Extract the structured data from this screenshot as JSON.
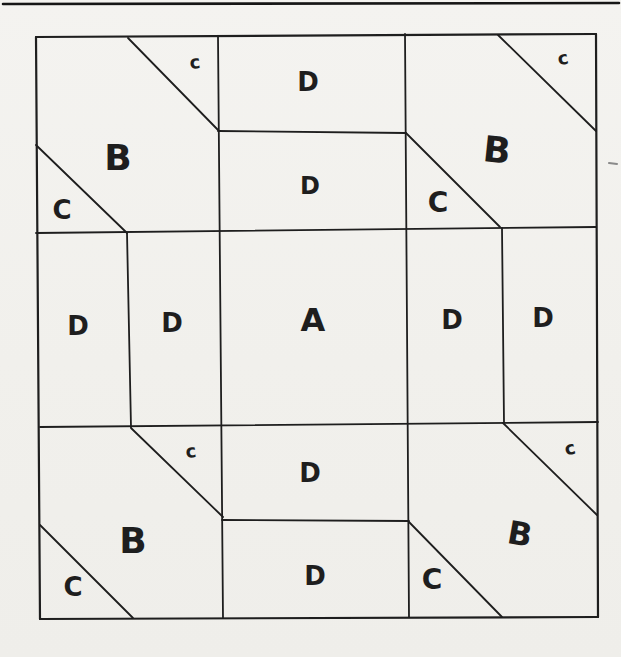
{
  "page": {
    "width": 621,
    "height": 657,
    "paper_color": "#f2f1ee",
    "ink_color": "#1e1e1e"
  },
  "header_rule": {
    "name": "page-header-rule",
    "x1": 3,
    "y1": 4,
    "x2": 619,
    "y2": 3,
    "w": 2.6,
    "color": "#161616"
  },
  "stray_mark": {
    "name": "stray-pen-mark",
    "x1": 609,
    "y1": 163,
    "x2": 617,
    "y2": 164,
    "w": 2,
    "color": "#8a8a8a"
  },
  "diagram": {
    "lines": [
      {
        "name": "outer-border-top",
        "x1": 36,
        "y1": 37,
        "x2": 596,
        "y2": 34,
        "w": 2.2
      },
      {
        "name": "outer-border-right",
        "x1": 596,
        "y1": 34,
        "x2": 598,
        "y2": 617,
        "w": 2.2
      },
      {
        "name": "outer-border-bottom",
        "x1": 598,
        "y1": 617,
        "x2": 40,
        "y2": 619,
        "w": 2.2
      },
      {
        "name": "outer-border-left",
        "x1": 40,
        "y1": 619,
        "x2": 36,
        "y2": 37,
        "w": 2.2
      },
      {
        "name": "vertical-divider-left",
        "x1": 218,
        "y1": 37,
        "x2": 223,
        "y2": 618,
        "w": 1.8
      },
      {
        "name": "vertical-divider-right",
        "x1": 405,
        "y1": 34,
        "x2": 409,
        "y2": 617,
        "w": 1.8
      },
      {
        "name": "horizontal-top-center",
        "x1": 218,
        "y1": 131,
        "x2": 406,
        "y2": 133,
        "w": 1.8
      },
      {
        "name": "horizontal-upper-band",
        "x1": 36,
        "y1": 233,
        "x2": 596,
        "y2": 227,
        "w": 1.8
      },
      {
        "name": "horizontal-lower-band",
        "x1": 40,
        "y1": 427,
        "x2": 598,
        "y2": 422,
        "w": 1.8
      },
      {
        "name": "horizontal-bottom-center",
        "x1": 222,
        "y1": 520,
        "x2": 409,
        "y2": 521,
        "w": 1.8
      },
      {
        "name": "vertical-short-midleft",
        "x1": 127,
        "y1": 233,
        "x2": 131,
        "y2": 427,
        "w": 1.8
      },
      {
        "name": "vertical-short-midright",
        "x1": 502,
        "y1": 228,
        "x2": 504,
        "y2": 422,
        "w": 1.8
      },
      {
        "name": "diagonal-topleft-small-c",
        "x1": 128,
        "y1": 38,
        "x2": 219,
        "y2": 131,
        "w": 1.8
      },
      {
        "name": "diagonal-topleft-big-C",
        "x1": 36,
        "y1": 145,
        "x2": 127,
        "y2": 233,
        "w": 1.8
      },
      {
        "name": "diagonal-topright-small-c",
        "x1": 498,
        "y1": 35,
        "x2": 596,
        "y2": 131,
        "w": 1.8
      },
      {
        "name": "diagonal-topright-big-C",
        "x1": 406,
        "y1": 133,
        "x2": 500,
        "y2": 227,
        "w": 1.8
      },
      {
        "name": "diagonal-bottomleft-small-c",
        "x1": 131,
        "y1": 428,
        "x2": 223,
        "y2": 517,
        "w": 1.8
      },
      {
        "name": "diagonal-bottomleft-big-C",
        "x1": 40,
        "y1": 525,
        "x2": 133,
        "y2": 618,
        "w": 1.8
      },
      {
        "name": "diagonal-bottomright-small-c",
        "x1": 503,
        "y1": 423,
        "x2": 597,
        "y2": 515,
        "w": 1.8
      },
      {
        "name": "diagonal-bottomright-big-C",
        "x1": 409,
        "y1": 522,
        "x2": 502,
        "y2": 617,
        "w": 1.8
      }
    ],
    "labels": [
      {
        "text": "c",
        "x": 195,
        "y": 62,
        "size": 18,
        "rot": -6
      },
      {
        "text": "D",
        "x": 308,
        "y": 82,
        "size": 26,
        "rot": 0
      },
      {
        "text": "c",
        "x": 563,
        "y": 58,
        "size": 18,
        "rot": -10
      },
      {
        "text": "B",
        "x": 118,
        "y": 157,
        "size": 36,
        "rot": 0
      },
      {
        "text": "D",
        "x": 310,
        "y": 186,
        "size": 24,
        "rot": 0
      },
      {
        "text": "B",
        "x": 497,
        "y": 150,
        "size": 36,
        "rot": 6
      },
      {
        "text": "C",
        "x": 62,
        "y": 210,
        "size": 26,
        "rot": 0
      },
      {
        "text": "C",
        "x": 438,
        "y": 202,
        "size": 28,
        "rot": 0
      },
      {
        "text": "D",
        "x": 78,
        "y": 326,
        "size": 26,
        "rot": 0
      },
      {
        "text": "D",
        "x": 172,
        "y": 323,
        "size": 26,
        "rot": 0
      },
      {
        "text": "A",
        "x": 313,
        "y": 320,
        "size": 32,
        "rot": 0
      },
      {
        "text": "D",
        "x": 452,
        "y": 320,
        "size": 26,
        "rot": 0
      },
      {
        "text": "D",
        "x": 543,
        "y": 318,
        "size": 26,
        "rot": 0
      },
      {
        "text": "c",
        "x": 191,
        "y": 451,
        "size": 18,
        "rot": -6
      },
      {
        "text": "D",
        "x": 310,
        "y": 473,
        "size": 26,
        "rot": 0
      },
      {
        "text": "c",
        "x": 570,
        "y": 448,
        "size": 18,
        "rot": -12
      },
      {
        "text": "B",
        "x": 133,
        "y": 540,
        "size": 36,
        "rot": 0
      },
      {
        "text": "B",
        "x": 520,
        "y": 534,
        "size": 32,
        "rot": 10
      },
      {
        "text": "D",
        "x": 315,
        "y": 576,
        "size": 26,
        "rot": 0
      },
      {
        "text": "C",
        "x": 73,
        "y": 587,
        "size": 26,
        "rot": 0
      },
      {
        "text": "C",
        "x": 432,
        "y": 579,
        "size": 28,
        "rot": 0
      }
    ]
  }
}
